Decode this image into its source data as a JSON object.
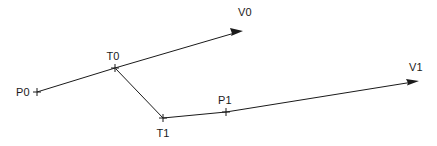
{
  "figure": {
    "background_color": "#ffffff",
    "stroke_color": "#1a1a1a",
    "width": 437,
    "height": 146
  },
  "labels": {
    "p0": "P0",
    "t0": "T0",
    "v0": "V0",
    "t1": "T1",
    "p1": "P1",
    "v1": "V1"
  },
  "points": [
    {
      "name": "P0",
      "label": "P0",
      "x": 37,
      "y": 92,
      "marker": "cross",
      "label_x": 16,
      "label_y": 96,
      "label_anchor": "start"
    },
    {
      "name": "T0",
      "label": "T0",
      "x": 115,
      "y": 68,
      "marker": "cross",
      "label_x": 113,
      "label_y": 60,
      "label_anchor": "middle"
    },
    {
      "name": "V0",
      "label": "V0",
      "x": 243,
      "y": 31,
      "marker": "arrow",
      "label_x": 245,
      "label_y": 16,
      "label_anchor": "middle"
    },
    {
      "name": "T1",
      "label": "T1",
      "x": 163,
      "y": 119,
      "marker": "cross",
      "label_x": 163,
      "label_y": 137,
      "label_anchor": "middle"
    },
    {
      "name": "P1",
      "label": "P1",
      "x": 226,
      "y": 112,
      "marker": "cross",
      "label_x": 225,
      "label_y": 104,
      "label_anchor": "middle"
    },
    {
      "name": "V1",
      "label": "V1",
      "x": 419,
      "y": 81,
      "marker": "arrow",
      "label_x": 416,
      "label_y": 71,
      "label_anchor": "middle"
    }
  ],
  "segments": [
    {
      "name": "p0-to-v0",
      "from": "P0",
      "to": "V0",
      "via": "T0",
      "path": "M 37 92 L 115 68 L 238 32",
      "arrow_at_end": true
    },
    {
      "name": "t0-to-t1",
      "from": "T0",
      "to": "T1",
      "path": "M 116 69 L 163 118",
      "arrow_at_end": false
    },
    {
      "name": "t1-to-v1",
      "from": "T1",
      "to": "V1",
      "via": "P1",
      "path": "M 163 118 L 226 112 L 413 82",
      "arrow_at_end": true
    }
  ],
  "arrows": [
    {
      "name": "v0-arrow-head",
      "tip_x": 243,
      "tip_y": 31,
      "angle_deg": -16.3
    },
    {
      "name": "v1-arrow-head",
      "tip_x": 419,
      "tip_y": 81,
      "angle_deg": -9.2
    }
  ]
}
